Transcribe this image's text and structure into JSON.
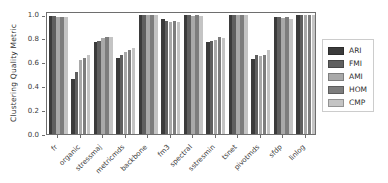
{
  "style": {
    "background": "#ffffff",
    "frame_color": "#6e6e6e",
    "text_color": "#3a3a3a",
    "legend_border": "#cccccc"
  },
  "layout": {
    "plot": {
      "left": 46,
      "top": 12,
      "width": 270,
      "height": 123
    },
    "legend": {
      "left": 322,
      "top": 39
    }
  },
  "chart_data": {
    "type": "bar",
    "title": "",
    "xlabel": "",
    "ylabel": "Clustering Quality Metric",
    "ylim": [
      0.0,
      1.03
    ],
    "yticks": [
      0.0,
      0.2,
      0.4,
      0.6,
      0.8,
      1.0
    ],
    "grid": false,
    "legend_position": "right",
    "categories": [
      "fr",
      "organic",
      "stressmaj",
      "metricmds",
      "backbone",
      "fm3",
      "spectral",
      "sstresmin",
      "tsnet",
      "pivotmds",
      "sfdp",
      "linlog"
    ],
    "series": [
      {
        "name": "ARI",
        "color": "#3b3b3b",
        "values": [
          0.99,
          0.46,
          0.77,
          0.64,
          1.0,
          0.96,
          1.0,
          0.77,
          1.0,
          0.63,
          0.98,
          1.0
        ]
      },
      {
        "name": "FMI",
        "color": "#5f5f5f",
        "values": [
          0.99,
          0.52,
          0.78,
          0.66,
          1.0,
          0.95,
          1.0,
          0.78,
          1.0,
          0.66,
          0.98,
          1.0
        ]
      },
      {
        "name": "AMI",
        "color": "#a9a9a9",
        "values": [
          0.98,
          0.62,
          0.8,
          0.69,
          1.0,
          0.94,
          0.99,
          0.79,
          1.0,
          0.65,
          0.97,
          1.0
        ]
      },
      {
        "name": "HOM",
        "color": "#7d7d7d",
        "values": [
          0.98,
          0.64,
          0.81,
          0.7,
          1.0,
          0.95,
          1.0,
          0.81,
          1.0,
          0.66,
          0.98,
          1.0
        ]
      },
      {
        "name": "CMP",
        "color": "#c4c4c4",
        "values": [
          0.98,
          0.66,
          0.81,
          0.72,
          1.0,
          0.94,
          0.99,
          0.8,
          1.0,
          0.7,
          0.96,
          1.0
        ]
      }
    ]
  }
}
